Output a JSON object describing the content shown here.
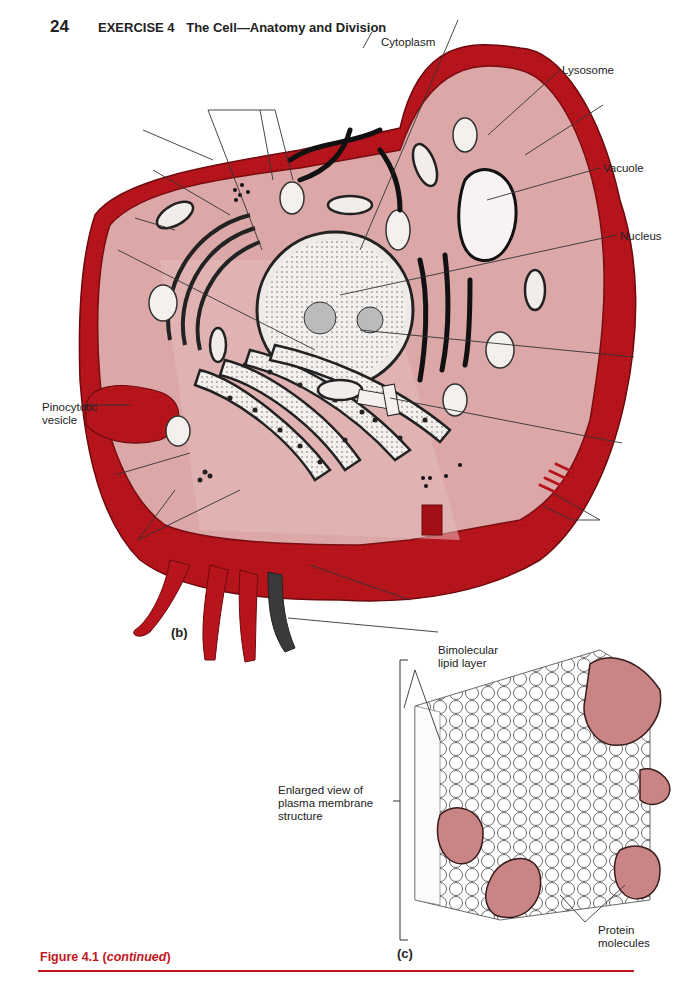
{
  "header": {
    "page_number": "24",
    "exercise": "EXERCISE 4",
    "title": "The Cell—Anatomy and Division"
  },
  "figure_b": {
    "panel_label": "(b)",
    "labels": {
      "cytoplasm": "Cytoplasm",
      "lysosome": "Lysosome",
      "vacuole": "Vacuole",
      "nucleus": "Nucleus",
      "pinocytotic_vesicle_line1": "Pinocytotic",
      "pinocytotic_vesicle_line2": "vesicle"
    },
    "unlabeled_leader_lines": 13
  },
  "figure_c": {
    "panel_label": "(c)",
    "labels": {
      "lipid_layer_line1": "Bimolecular",
      "lipid_layer_line2": "lipid layer",
      "enlarged_line1": "Enlarged view of",
      "enlarged_line2": "plasma membrane",
      "enlarged_line3": "structure",
      "protein_line1": "Protein",
      "protein_line2": "molecules"
    }
  },
  "caption": {
    "figure": "Figure 4.1",
    "note": "continued"
  },
  "colors": {
    "membrane_red": "#b8141c",
    "cytoplasm_pink": "#d9a3a3",
    "protein_pink": "#c98585",
    "caption_red": "#c4161c"
  }
}
